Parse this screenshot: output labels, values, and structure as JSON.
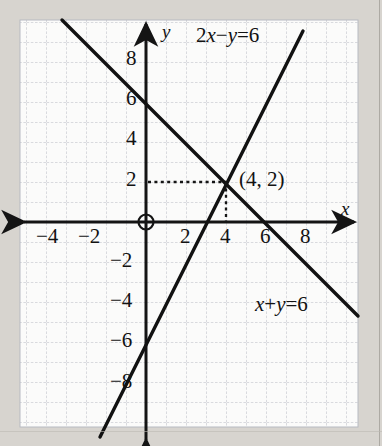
{
  "figure": {
    "axis_labels": {
      "x": "x",
      "y": "y"
    },
    "origin_symbol": "⊕"
  },
  "chart_data": {
    "type": "line",
    "title": "",
    "xlabel": "x",
    "ylabel": "y",
    "xlim": [
      -6,
      10
    ],
    "ylim": [
      -10,
      9
    ],
    "grid": true,
    "grid_step": 1,
    "legend": "inline-labels",
    "x_ticks": [
      "-4",
      "-2",
      "2",
      "4",
      "6",
      "8"
    ],
    "x_tick_values": [
      -4,
      -2,
      2,
      4,
      6,
      8
    ],
    "y_ticks": [
      "8",
      "6",
      "4",
      "2",
      "-2",
      "-4",
      "-6",
      "-8"
    ],
    "y_tick_values": [
      8,
      6,
      4,
      2,
      -2,
      -4,
      -6,
      -8
    ],
    "series": [
      {
        "name": "x+y=6",
        "label": "x+y=6",
        "label_parts": {
          "a": "x",
          "op1": "+",
          "b": "y",
          "eq": "=",
          "c": "6"
        },
        "slope": -1,
        "intercept": 6,
        "points": [
          [
            -2,
            8
          ],
          [
            0,
            6
          ],
          [
            4,
            2
          ],
          [
            6,
            0
          ],
          [
            10,
            -4
          ]
        ]
      },
      {
        "name": "2x-y=6",
        "label": "2x−y=6",
        "label_parts": {
          "a": "2x",
          "op1": "−",
          "b": "y",
          "eq": "=",
          "c": "6"
        },
        "slope": 2,
        "intercept": -6,
        "points": [
          [
            -1,
            -8
          ],
          [
            0,
            -6
          ],
          [
            3,
            0
          ],
          [
            4,
            2
          ],
          [
            7.4,
            8.8
          ]
        ]
      }
    ],
    "annotations": [
      {
        "name": "solution-point",
        "text": "(4, 2)",
        "x": 4,
        "y": 2,
        "guides": [
          "horizontal-to-y-axis",
          "vertical-to-x-axis"
        ]
      }
    ]
  },
  "labels": {
    "eq_top": "2x−y=6",
    "eq_bottom": "x+y=6",
    "solution": "(4, 2)",
    "x_axis": "x",
    "y_axis": "y",
    "origin": "⊕",
    "x_tick_m4": "−4",
    "x_tick_m2": "−2",
    "x_tick_2": "2",
    "x_tick_4": "4",
    "x_tick_6": "6",
    "x_tick_8": "8",
    "y_tick_8": "8",
    "y_tick_6": "6",
    "y_tick_4": "4",
    "y_tick_2": "2",
    "y_tick_m2": "−2",
    "y_tick_m4": "−4",
    "y_tick_m6": "−6",
    "y_tick_m8": "−8"
  },
  "colors": {
    "page_background": "#d7d4cf",
    "plot_background": "#fbfbfa",
    "grid_line": "#b9bcc4",
    "axis": "#151515",
    "line": "#121212",
    "text": "#121212"
  }
}
